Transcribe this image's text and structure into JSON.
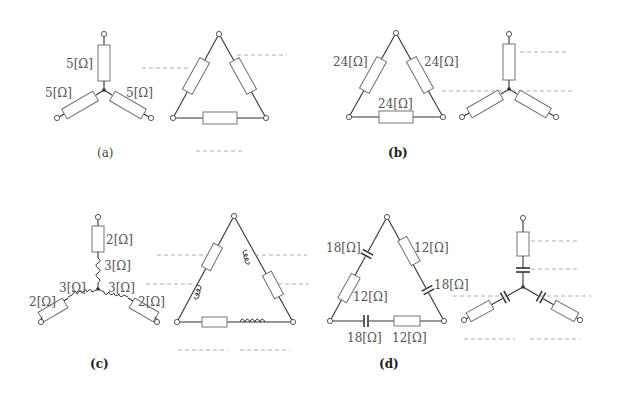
{
  "figure": {
    "panels": [
      {
        "id": "a",
        "caption": "(a)",
        "given": "wye",
        "given_labels": [
          "5[Ω]",
          "5[Ω]",
          "5[Ω]"
        ],
        "answer_shape": "delta",
        "answer_blanks": 3
      },
      {
        "id": "b",
        "caption": "(b)",
        "given": "delta",
        "given_labels": [
          "24[Ω]",
          "24[Ω]",
          "24[Ω]"
        ],
        "answer_shape": "wye",
        "answer_blanks": 2
      },
      {
        "id": "c",
        "caption": "(c)",
        "given": "wye",
        "given_labels": [
          "2[Ω]",
          "3[Ω]",
          "3[Ω]",
          "3[Ω]",
          "2[Ω]",
          "2[Ω]"
        ],
        "answer_shape": "delta",
        "answer_blanks": 6
      },
      {
        "id": "d",
        "caption": "(d)",
        "given": "delta",
        "given_labels": [
          "18[Ω]",
          "12[Ω]",
          "12[Ω]",
          "18[Ω]",
          "18[Ω]",
          "12[Ω]"
        ],
        "answer_shape": "wye",
        "answer_blanks": 6
      }
    ]
  }
}
